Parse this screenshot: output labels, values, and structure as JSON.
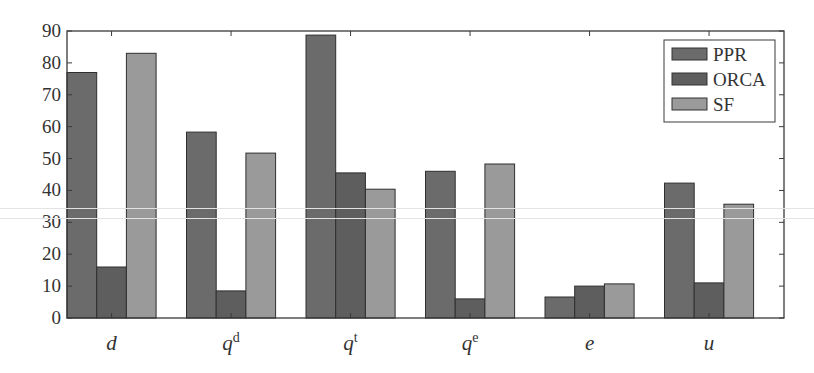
{
  "chart_data": {
    "type": "bar",
    "title": "",
    "xlabel": "",
    "ylabel": "",
    "ylim": [
      0,
      90
    ],
    "yticks": [
      0,
      10,
      20,
      30,
      40,
      50,
      60,
      70,
      80,
      90
    ],
    "grid": false,
    "legend_position": "upper right",
    "categories": [
      {
        "base": "d",
        "sup": ""
      },
      {
        "base": "q",
        "sup": "d"
      },
      {
        "base": "q",
        "sup": "t"
      },
      {
        "base": "q",
        "sup": "e"
      },
      {
        "base": "e",
        "sup": ""
      },
      {
        "base": "u",
        "sup": ""
      }
    ],
    "category_labels": [
      "d",
      "q^d",
      "q^t",
      "q^e",
      "e",
      "u"
    ],
    "series": [
      {
        "name": "PPR",
        "color": "#6b6b6b",
        "values": [
          77,
          58.3,
          88.7,
          46,
          6.6,
          42.3
        ]
      },
      {
        "name": "ORCA",
        "color": "#5e5e5e",
        "values": [
          16,
          8.5,
          45.5,
          6,
          10,
          11
        ]
      },
      {
        "name": "SF",
        "color": "#9a9a9a",
        "values": [
          83,
          51.7,
          40.4,
          48.3,
          10.7,
          35.7
        ]
      }
    ]
  },
  "legend": {
    "items": [
      "PPR",
      "ORCA",
      "SF"
    ]
  }
}
